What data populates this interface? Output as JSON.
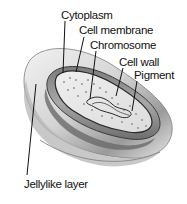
{
  "diagram": {
    "labels": {
      "cytoplasm": "Cytoplasm",
      "cell_membrane": "Cell membrane",
      "chromosome": "Chromosome",
      "cell_wall": "Cell wall",
      "pigment": "Pigment",
      "jellylike_layer": "Jellylike layer"
    },
    "colors": {
      "background": "#ffffff",
      "outer_layer": "#d9d9d9",
      "outer_layer_shadow": "#8a8a8a",
      "cell_wall": "#5a5a5a",
      "cytoplasm": "#e6e6e6",
      "text": "#111111",
      "leader_line": "#111111"
    }
  }
}
